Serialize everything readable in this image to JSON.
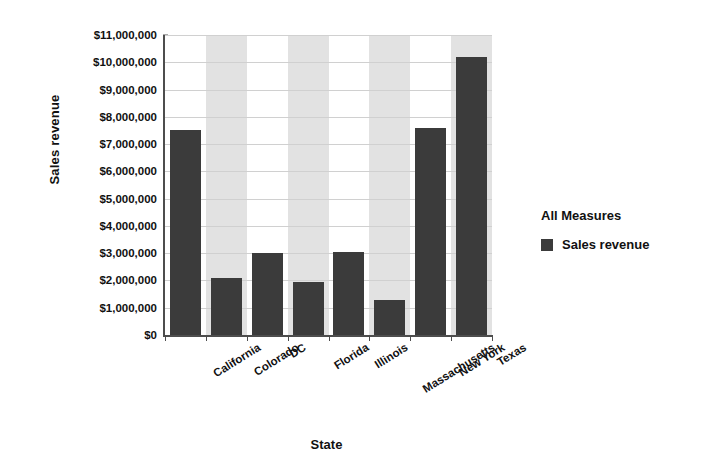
{
  "chart_data": {
    "type": "bar",
    "title": "",
    "xlabel": "State",
    "ylabel": "Sales revenue",
    "categories": [
      "California",
      "Colorado",
      "DC",
      "Florida",
      "Illinois",
      "Massachusetts",
      "New York",
      "Texas"
    ],
    "values": [
      7500000,
      2100000,
      3000000,
      1950000,
      3050000,
      1300000,
      7600000,
      10200000
    ],
    "series": [
      {
        "name": "Sales revenue",
        "values": [
          7500000,
          2100000,
          3000000,
          1950000,
          3050000,
          1300000,
          7600000,
          10200000
        ],
        "color": "#3b3b3b"
      }
    ],
    "ylim": [
      0,
      11000000
    ],
    "ytick_values": [
      0,
      1000000,
      2000000,
      3000000,
      4000000,
      5000000,
      6000000,
      7000000,
      8000000,
      9000000,
      10000000,
      11000000
    ],
    "ytick_labels": [
      "$0",
      "$1,000,000",
      "$2,000,000",
      "$3,000,000",
      "$4,000,000",
      "$5,000,000",
      "$6,000,000",
      "$7,000,000",
      "$8,000,000",
      "$9,000,000",
      "$10,000,000",
      "$11,000,000"
    ],
    "grid": true,
    "alternating_band_color": "#e2e2e2",
    "banded_categories": [
      "Colorado",
      "Florida",
      "Massachusetts",
      "Texas"
    ],
    "legend_position": "right"
  },
  "legend": {
    "title": "All Measures",
    "entries": [
      {
        "label": "Sales revenue",
        "color": "#3b3b3b"
      }
    ]
  },
  "axes": {
    "y_title": "Sales revenue",
    "x_title": "State"
  }
}
